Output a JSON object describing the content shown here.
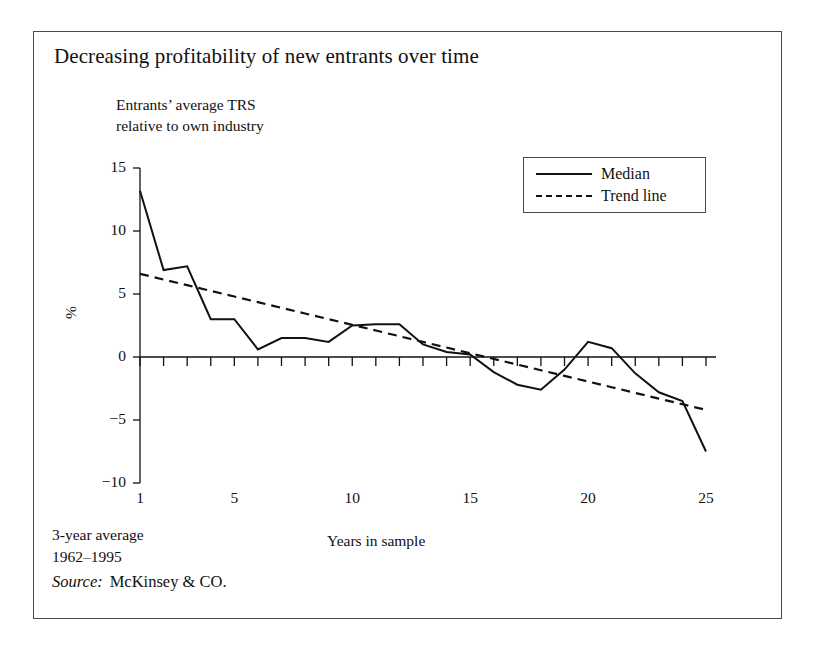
{
  "figure": {
    "title": "Decreasing profitability of new entrants over time",
    "axis_note": "Entrants’ average TRS\nrelative to own industry",
    "footnote": "3-year average\n  1962–1995",
    "source_label": "Source:",
    "source_value": "McKinsey & CO.",
    "frame_color": "#4a4a4a",
    "line_color": "#111111",
    "background": "#ffffff"
  },
  "legend": {
    "position": "top-right",
    "entries": [
      {
        "label": "Median",
        "style": "solid"
      },
      {
        "label": "Trend line",
        "style": "dashed"
      }
    ]
  },
  "chart_data": {
    "type": "line",
    "title": "Decreasing profitability of new entrants over time",
    "subtitle": "Entrants’ average TRS relative to own industry",
    "xlabel": "Years in sample",
    "ylabel": "%",
    "xlim": [
      1,
      25
    ],
    "ylim": [
      -10,
      15
    ],
    "grid": false,
    "legend_position": "top-right",
    "xticks": [
      1,
      5,
      10,
      15,
      20,
      25
    ],
    "xtick_labels": [
      "1",
      "5",
      "10",
      "15",
      "20",
      "25"
    ],
    "yticks": [
      15,
      10,
      5,
      0,
      -5,
      -10
    ],
    "ytick_labels": [
      "15",
      "10",
      "5",
      "0",
      "−5",
      "−10"
    ],
    "minor_xticks": [
      2,
      3,
      4,
      6,
      7,
      8,
      9,
      11,
      12,
      13,
      14,
      16,
      17,
      18,
      19,
      21,
      22,
      23,
      24
    ],
    "x": [
      1,
      2,
      3,
      4,
      5,
      6,
      7,
      8,
      9,
      10,
      11,
      12,
      13,
      14,
      15,
      16,
      17,
      18,
      19,
      20,
      21,
      22,
      23,
      24,
      25
    ],
    "series": [
      {
        "name": "Median",
        "style": "solid",
        "values": [
          13.2,
          6.9,
          7.2,
          3.0,
          3.0,
          0.6,
          1.5,
          1.5,
          1.2,
          2.5,
          2.6,
          2.6,
          1.0,
          0.4,
          0.2,
          -1.2,
          -2.2,
          -2.6,
          -1.0,
          1.2,
          0.7,
          -1.3,
          -2.8,
          -3.5,
          -7.5
        ]
      },
      {
        "name": "Trend line",
        "style": "dashed",
        "values": [
          6.6,
          6.15,
          5.7,
          5.25,
          4.8,
          4.35,
          3.9,
          3.45,
          3.0,
          2.55,
          2.1,
          1.65,
          1.2,
          0.75,
          0.3,
          -0.15,
          -0.6,
          -1.05,
          -1.5,
          -1.95,
          -2.4,
          -2.85,
          -3.3,
          -3.75,
          -4.2
        ]
      }
    ],
    "annotations": [
      "3-year average 1962–1995",
      "Source: McKinsey & CO."
    ]
  }
}
